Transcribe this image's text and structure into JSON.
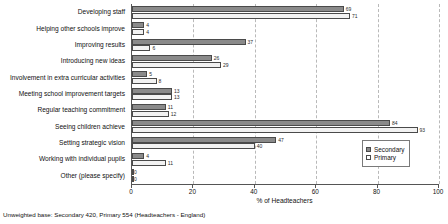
{
  "chart_data": {
    "type": "bar",
    "orientation": "horizontal",
    "title": "",
    "xlabel": "% of Headteachers",
    "ylabel": "",
    "xlim": [
      0,
      100
    ],
    "xticks": [
      0,
      20,
      40,
      60,
      80,
      100
    ],
    "grid": true,
    "grid_style": "dashed vertical",
    "legend_position": "bottom-right",
    "categories": [
      "Developing staff",
      "Helping other schools improve",
      "Improving results",
      "Introducing new ideas",
      "Involvement in extra curricular activities",
      "Meeting school improvement targets",
      "Regular teaching commitment",
      "Seeing children achieve",
      "Setting strategic vision",
      "Working with individual pupils",
      "Other (please specify)"
    ],
    "series": [
      {
        "name": "Secondary",
        "color": "#8a8a8a",
        "values": [
          69,
          4,
          37,
          26,
          5,
          13,
          11,
          84,
          47,
          4,
          0
        ]
      },
      {
        "name": "Primary",
        "color": "#f2f2f2",
        "values": [
          71,
          4,
          6,
          29,
          8,
          13,
          12,
          93,
          40,
          11,
          0
        ]
      }
    ]
  },
  "legend": {
    "items": [
      {
        "label": "Secondary",
        "swatch": "secondary"
      },
      {
        "label": "Primary",
        "swatch": "primary"
      }
    ]
  },
  "footnote": {
    "text": "Unweighted base: Secondary 420, Primary 554 (Headteachers - England)"
  }
}
